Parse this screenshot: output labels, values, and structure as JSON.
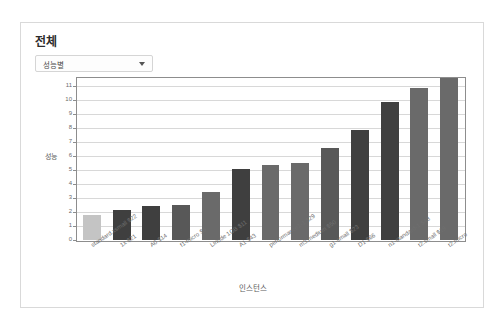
{
  "card": {
    "title": "전체",
    "filter_select": {
      "value": "성능별",
      "caret_icon": "chevron-down-icon"
    }
  },
  "chart_data": {
    "type": "bar",
    "title": "",
    "xlabel": "인스턴스",
    "ylabel": "성능",
    "ylim": [
      0,
      11.6
    ],
    "yticks": [
      0,
      1,
      2,
      3,
      4,
      5,
      6,
      7,
      8,
      9,
      10,
      11
    ],
    "grid": true,
    "legend": "none",
    "categories": [
      "standard.xsmall $22",
      "1x $21",
      "A0 $14",
      "f1-micro $9",
      "Linode 1GB $11",
      "A1 $43",
      "performance1-1 $29",
      "m3.medium $50",
      "g1-small $23",
      "D1 $66",
      "n1-standard-1 $48",
      "t2.small $19",
      "t2.micro"
    ],
    "values": [
      1.8,
      2.15,
      2.45,
      2.5,
      3.45,
      5.1,
      5.4,
      5.5,
      6.6,
      7.85,
      9.85,
      10.85,
      11.6
    ],
    "bar_colors": [
      "#c4c4c4",
      "#3f3f3f",
      "#3f3f3f",
      "#585858",
      "#6a6a6a",
      "#3f3f3f",
      "#6a6a6a",
      "#6a6a6a",
      "#585858",
      "#3f3f3f",
      "#3f3f3f",
      "#6a6a6a",
      "#6a6a6a"
    ]
  },
  "colors": {
    "card_border": "#d9d9d9",
    "plot_frame": "#8d8d8d",
    "gridline": "#d8d8d8",
    "text": "#5d5d5d"
  }
}
